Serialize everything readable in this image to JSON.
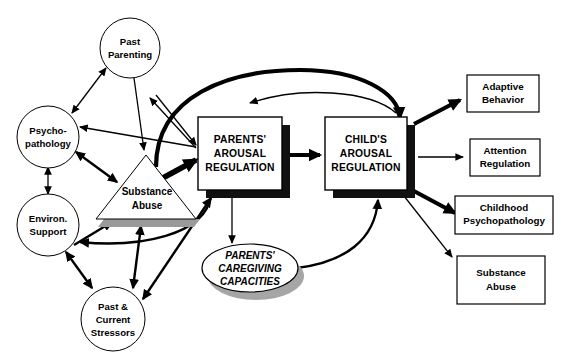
{
  "diagram": {
    "background_color": "#ffffff",
    "line_color": "#000000",
    "shadow_color_box": "#111111",
    "shadow_color_soft": "#9a9a9a",
    "nodes": {
      "past_parenting": {
        "label_line1": "Past",
        "label_line2": "Parenting",
        "shape": "circle"
      },
      "psychopathology": {
        "label_line1": "Psycho-",
        "label_line2": "pathology",
        "shape": "circle"
      },
      "environ_support": {
        "label_line1": "Environ.",
        "label_line2": "Support",
        "shape": "circle"
      },
      "past_current_stressors": {
        "label_line1": "Past &",
        "label_line2": "Current",
        "label_line3": "Stressors",
        "shape": "circle"
      },
      "substance_abuse_triangle": {
        "label_line1": "Substance",
        "label_line2": "Abuse",
        "shape": "triangle"
      },
      "parents_arousal_regulation": {
        "label_line1": "PARENTS'",
        "label_line2": "AROUSAL",
        "label_line3": "REGULATION",
        "shape": "box-shadow"
      },
      "childs_arousal_regulation": {
        "label_line1": "CHILD'S",
        "label_line2": "AROUSAL",
        "label_line3": "REGULATION",
        "shape": "box-shadow"
      },
      "parents_caregiving_capacities": {
        "label_line1": "PARENTS'",
        "label_line2": "CAREGIVING",
        "label_line3": "CAPACITIES",
        "shape": "ellipse-shadow"
      },
      "adaptive_behavior": {
        "label_line1": "Adaptive",
        "label_line2": "Behavior",
        "shape": "box"
      },
      "attention_regulation": {
        "label_line1": "Attention",
        "label_line2": "Regulation",
        "shape": "box"
      },
      "childhood_psychopathology": {
        "label_line1": "Childhood",
        "label_line2": "Psychopathology",
        "shape": "box"
      },
      "substance_abuse_outcome": {
        "label_line1": "Substance",
        "label_line2": "Abuse",
        "shape": "box"
      }
    }
  }
}
